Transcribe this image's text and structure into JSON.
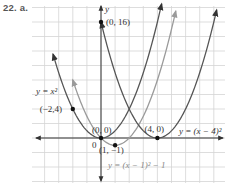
{
  "problem_label": "22. a.",
  "chart_data": {
    "type": "line",
    "title": "",
    "xlabel": "x",
    "ylabel": "y",
    "xlim": [
      -5,
      9
    ],
    "ylim": [
      -5,
      18
    ],
    "grid": true,
    "x_grid_step": 1,
    "y_grid_step": 2,
    "series": [
      {
        "name": "y = x^2",
        "label": "y = x²",
        "formula": "x^2",
        "h": 0,
        "k": 0,
        "color": "#555555",
        "x_range": [
          -3.4,
          4.3
        ]
      },
      {
        "name": "y = (x - 1)^2 - 1",
        "label": "y = (x − 1)² − 1",
        "formula": "(x-1)^2-1",
        "h": 1,
        "k": -1,
        "color": "#9a9a9a",
        "x_range": [
          -2.0,
          5.3
        ]
      },
      {
        "name": "y = (x - 4)^2",
        "label": "y = (x − 4)²",
        "formula": "(x-4)^2",
        "h": 4,
        "k": 0,
        "color": "#555555",
        "x_range": [
          0.0,
          8.2
        ]
      }
    ],
    "points": [
      {
        "x": 0,
        "y": 16,
        "label": "(0, 16)"
      },
      {
        "x": -2,
        "y": 4,
        "label": "(−2,4)"
      },
      {
        "x": 0,
        "y": 0,
        "label": "(0, 0)"
      },
      {
        "x": 1,
        "y": -1,
        "label": "(1, −1)"
      },
      {
        "x": 4,
        "y": 0,
        "label": "(4, 0)"
      }
    ],
    "axis_labels": {
      "x": "x",
      "y": "y",
      "origin": "0"
    }
  }
}
